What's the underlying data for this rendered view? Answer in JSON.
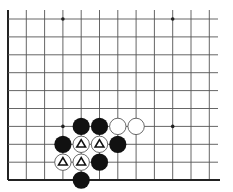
{
  "diagram": {
    "type": "go-board-partial",
    "edges": [
      "left",
      "bottom"
    ],
    "grid": {
      "columns": 12,
      "rows": 10,
      "x0": 8,
      "y0": 19,
      "dx": 18.3,
      "dy": 17.9,
      "right_extent": 218,
      "top_extent": 10
    },
    "star_points": [
      {
        "col": 3,
        "row": 0
      },
      {
        "col": 9,
        "row": 0
      },
      {
        "col": 3,
        "row": 6
      },
      {
        "col": 9,
        "row": 6
      }
    ],
    "stones": [
      {
        "color": "black",
        "col": 4,
        "row": 6,
        "mark": ""
      },
      {
        "color": "black",
        "col": 5,
        "row": 6,
        "mark": ""
      },
      {
        "color": "white",
        "col": 6,
        "row": 6,
        "mark": ""
      },
      {
        "color": "white",
        "col": 7,
        "row": 6,
        "mark": ""
      },
      {
        "color": "black",
        "col": 3,
        "row": 7,
        "mark": ""
      },
      {
        "color": "white",
        "col": 4,
        "row": 7,
        "mark": "triangle"
      },
      {
        "color": "white",
        "col": 5,
        "row": 7,
        "mark": "triangle"
      },
      {
        "color": "black",
        "col": 6,
        "row": 7,
        "mark": ""
      },
      {
        "color": "white",
        "col": 3,
        "row": 8,
        "mark": "triangle"
      },
      {
        "color": "white",
        "col": 4,
        "row": 8,
        "mark": "triangle"
      },
      {
        "color": "black",
        "col": 5,
        "row": 8,
        "mark": ""
      },
      {
        "color": "black",
        "col": 4,
        "row": 9,
        "mark": ""
      }
    ],
    "colors": {
      "line": "#555555",
      "edge": "#222222",
      "black_stone": "#111111",
      "white_stone": "#ffffff",
      "white_stone_outline": "#444444",
      "mark": "#111111"
    }
  }
}
